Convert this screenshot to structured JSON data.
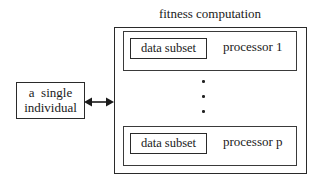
{
  "diagram": {
    "title": "fitness computation",
    "individual": {
      "line1": "a  single",
      "line2": "individual"
    },
    "connector": "bidirectional-arrow",
    "processors": [
      {
        "subset_label": "data subset",
        "label": "processor 1"
      },
      {
        "subset_label": "data subset",
        "label": "processor p"
      }
    ],
    "ellipsis": "vertical-dots",
    "colors": {
      "stroke": "#2a2a2a",
      "background": "#ffffff"
    }
  }
}
